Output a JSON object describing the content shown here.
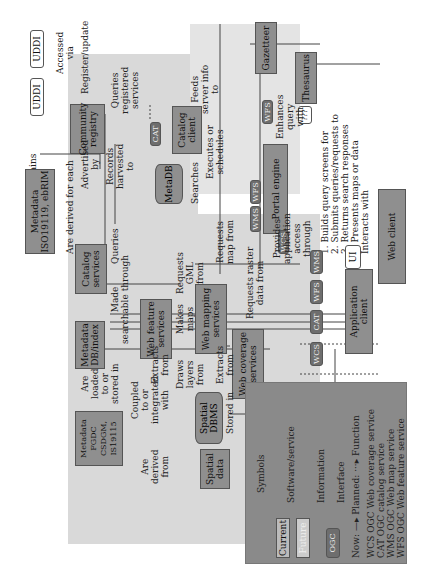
{
  "nodes": {
    "uddi1": "UDDI",
    "uddi2": "UDDI",
    "community_registry": "Community\nregistry",
    "metadata_iso": "Metadata\nISO19119, ebRIM",
    "catalog_services": "Catalog\nservices",
    "catalog_client": "Catalog\nclient",
    "metadb": "MetaDB",
    "portal_engine": "Portal engine",
    "gazetteer": "Gazetteer",
    "thesaurus": "Thesaurus",
    "unknown": "???",
    "ui": "UI",
    "web_client": "Web client",
    "web_feature_services": "Web feature\nservices",
    "web_mapping_services": "Web mapping\nservices",
    "web_coverage_services": "Web coverage\nservices",
    "application_client": "Application\nclient",
    "metadata_db_index": "Metadata\nDB/index",
    "spatial_dbms": "Spatial\nDBMS",
    "metadata_fgdc": "Metadata\nFGDC\nCSDGM,\nIS19115",
    "spatial_data": "Spatial\ndata"
  },
  "badges": {
    "cat": "CAT",
    "wfs_gaz": "WFS",
    "wms": "WMS",
    "wfs": "WFS",
    "wcs": "WCS",
    "app_wms": "WMS",
    "app_wfs": "WFS",
    "app_cat": "CAT",
    "app_wcs": "WCS"
  },
  "edge_labels": {
    "accessed_via": "Accessed\nvia",
    "register_update": "Register/update",
    "contains": "Contains",
    "queries_registered": "Queries\nregistered\nservices",
    "feeds_server_info": "Feeds\nserver info\nto",
    "advertised_by": "Advertised\nby",
    "records_harvested": "Records\nharvested\nto",
    "are_derived_each": "Are derived for each",
    "executes_schedules": "Executes or\nschedules",
    "searches": "Searches",
    "enhances_query": "Enhances\nquery\nwith",
    "queries": "Queries",
    "requests_gml": "Requests\nGML\nfrom",
    "makes_maps": "Makes\nmaps\nfrom",
    "requests_map": "Requests\nmap from",
    "requests_raster": "Requests raster\ndata from",
    "provides_access": "Provides\napplication\naccess\nthrough",
    "steps": "1. Builds query screens for\n2. Submits queries/requests to\n3. Returns search responses\n4. Presents maps or data",
    "step_nums": "1  2  3, 4",
    "interacts_with": "Interacts with",
    "made_searchable": "Made\nsearchable through",
    "extracts_from_wfs": "Extracts\nfrom",
    "draws_layers": "Draws\nlayers\nfrom",
    "extracts_from_wcs": "Extracts\nfrom",
    "are_loaded": "Are\nloaded\nto or\nstored in",
    "coupled": "Coupled\nto or\nintegrated\nwith",
    "are_derived_from": "Are\nderived\nfrom",
    "stored_in": "Stored in"
  },
  "legend": {
    "title": "Symbols",
    "current": "Current",
    "future": "Future",
    "software_service": "Software/service",
    "information": "Information",
    "interface": "Interface",
    "ogc": "OGC",
    "now_planned": "Now: —▸ Planned: ···▸ Function",
    "items": [
      {
        "code": "WCS",
        "desc": "OGC Web coverage service"
      },
      {
        "code": "CAT",
        "desc": "OGC catalog service"
      },
      {
        "code": "WMS",
        "desc": "OGC Web map service"
      },
      {
        "code": "WFS",
        "desc": "OGC Web feature service"
      }
    ]
  }
}
